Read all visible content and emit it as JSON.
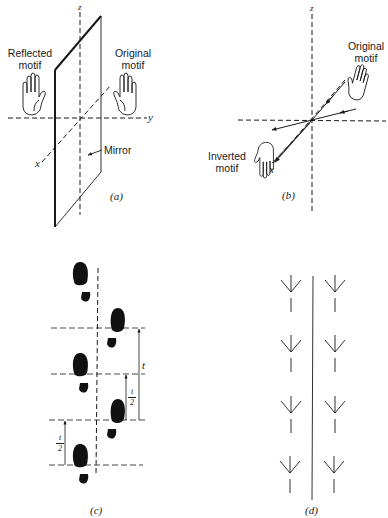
{
  "panels": {
    "a": {
      "caption": "(a)",
      "reflected_label_line1": "Reflected",
      "reflected_label_line2": "motif",
      "original_label_line1": "Original",
      "original_label_line2": "motif",
      "mirror_label": "Mirror",
      "axis_z": "z",
      "axis_y": "y",
      "axis_x": "x"
    },
    "b": {
      "caption": "(b)",
      "original_label_line1": "Original",
      "original_label_line2": "motif",
      "inverted_label_line1": "Inverted",
      "inverted_label_line2": "motif",
      "axis_z": "z",
      "axis_y": "y",
      "axis_x": "x"
    },
    "c": {
      "caption": "(c)",
      "translation_label": "t",
      "half_num": "t",
      "half_den": "2",
      "footprint_count": 7
    },
    "d": {
      "caption": "(d)",
      "bird_track_rows": 4,
      "bird_track_columns": 2
    }
  },
  "colors": {
    "ink": "#1a1a1a",
    "background": "#ffffff"
  }
}
